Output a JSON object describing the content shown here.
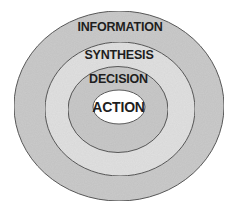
{
  "diagram": {
    "type": "concentric-ellipses",
    "layers": [
      {
        "label": "INFORMATION",
        "level": 1,
        "fill": "#cbcbcb"
      },
      {
        "label": "SYNTHESIS",
        "level": 2,
        "fill": "#e1e1e1"
      },
      {
        "label": "DECISION",
        "level": 3,
        "fill": "#c9c9c9"
      },
      {
        "label": "ACTION",
        "level": 4,
        "fill": "#ffffff"
      }
    ],
    "stroke_color": "#5a5a5a"
  }
}
